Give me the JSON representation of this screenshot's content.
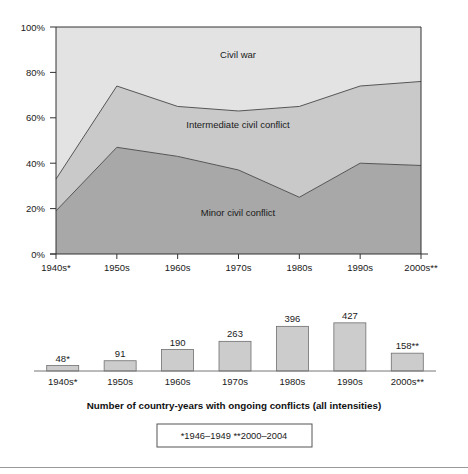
{
  "figure": {
    "caption": "Number of country-years with ongoing conflicts (all intensities)",
    "footnote": "*1946–1949    **2000–2004"
  },
  "colors": {
    "minor": "#a8a8a8",
    "intermediate": "#c9c9c9",
    "civil_war": "#e3e3e3",
    "bar_fill": "#cccccc",
    "line": "#555555",
    "axis": "#333333",
    "text": "#1a1a1a"
  },
  "chart_data": [
    {
      "type": "area",
      "title": "",
      "subtitle": "",
      "xlabel": "",
      "ylabel": "",
      "stacked": true,
      "percentage": true,
      "grid": false,
      "legend_position": "inline-labels",
      "ylim": [
        0,
        100
      ],
      "ytick_labels": [
        "0%",
        "20%",
        "40%",
        "60%",
        "80%",
        "100%"
      ],
      "yticks": [
        0,
        20,
        40,
        60,
        80,
        100
      ],
      "categories": [
        "1940s*",
        "1950s",
        "1960s",
        "1970s",
        "1980s",
        "1990s",
        "2000s**"
      ],
      "series": [
        {
          "name": "Minor civil conflict",
          "values": [
            19,
            47,
            43,
            37,
            25,
            40,
            39
          ]
        },
        {
          "name": "Intermediate civil conflict",
          "values": [
            14,
            27,
            22,
            26,
            40,
            34,
            37
          ]
        },
        {
          "name": "Civil war",
          "values": [
            67,
            26,
            35,
            37,
            35,
            26,
            24
          ]
        }
      ],
      "cumulative_tops": {
        "minor": [
          19,
          47,
          43,
          37,
          25,
          40,
          39
        ],
        "intermediate": [
          33,
          74,
          65,
          63,
          65,
          74,
          76
        ],
        "civil_war": [
          100,
          100,
          100,
          100,
          100,
          100,
          100
        ]
      },
      "annotations": [
        {
          "text": "Civil war",
          "x_pct": 50,
          "y_pct": 87
        },
        {
          "text": "Intermediate civil conflict",
          "x_pct": 50,
          "y_pct": 54
        },
        {
          "text": "Minor civil conflict",
          "x_pct": 50,
          "y_pct": 17
        }
      ]
    },
    {
      "type": "bar",
      "title": "Number of country-years with ongoing conflicts (all intensities)",
      "xlabel": "",
      "ylabel": "",
      "grid": false,
      "ylim": [
        0,
        470
      ],
      "categories": [
        "1940s*",
        "1950s",
        "1960s",
        "1970s",
        "1980s",
        "1990s",
        "2000s**"
      ],
      "values": [
        48,
        91,
        190,
        263,
        396,
        427,
        158
      ],
      "value_labels": [
        "48*",
        "91",
        "190",
        "263",
        "396",
        "427",
        "158**"
      ]
    }
  ]
}
